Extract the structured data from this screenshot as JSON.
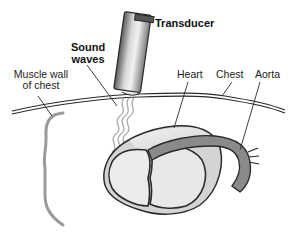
{
  "diagram": {
    "labels": {
      "transducer": "Transducer",
      "sound_waves_line1": "Sound",
      "sound_waves_line2": "waves",
      "muscle_wall_line1": "Muscle wall",
      "muscle_wall_line2": "of chest",
      "heart": "Heart",
      "chest": "Chest",
      "aorta": "Aorta"
    },
    "colors": {
      "outline": "#2a2a2a",
      "light_fill": "#e6e6e6",
      "mid_fill": "#c8c8c8",
      "dark_fill": "#8a8a8a",
      "muscle_wall": "#9a9a9a"
    }
  }
}
